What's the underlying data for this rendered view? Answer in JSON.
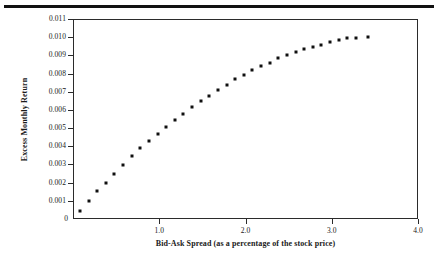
{
  "figure": {
    "top_rule": "horizontal-rule",
    "background_color": "#ffffff",
    "marker_color": "#101010",
    "axis_color": "#2b2b2b"
  },
  "chart_data": {
    "type": "scatter",
    "title": "",
    "subtitle": "",
    "xlabel": "Bid-Ask Spread (as a percentage of the stock price)",
    "ylabel": "Excess Monthly Return",
    "xlim": [
      0,
      4.0
    ],
    "ylim": [
      0,
      0.011
    ],
    "grid": false,
    "legend": null,
    "xticks": [
      0,
      1.0,
      2.0,
      3.0,
      4.0
    ],
    "xtick_labels": [
      "0",
      "1.0",
      "2.0",
      "3.0",
      "4.0"
    ],
    "yticks": [
      0,
      0.001,
      0.002,
      0.003,
      0.004,
      0.005,
      0.006,
      0.007,
      0.008,
      0.009,
      0.01,
      0.011
    ],
    "ytick_labels": [
      "0",
      "0.001",
      "0.002",
      "0.003",
      "0.004",
      "0.005",
      "0.006",
      "0.007",
      "0.008",
      "0.009",
      "0.010",
      "0.011"
    ],
    "x": [
      0.08,
      0.18,
      0.28,
      0.38,
      0.48,
      0.58,
      0.68,
      0.78,
      0.88,
      0.98,
      1.08,
      1.18,
      1.28,
      1.38,
      1.48,
      1.58,
      1.68,
      1.78,
      1.88,
      1.98,
      2.08,
      2.18,
      2.28,
      2.38,
      2.48,
      2.58,
      2.68,
      2.78,
      2.88,
      2.98,
      3.08,
      3.18,
      3.28,
      3.42
    ],
    "y": [
      0.00045,
      0.00098,
      0.00152,
      0.002,
      0.00246,
      0.00299,
      0.00347,
      0.00389,
      0.00429,
      0.00468,
      0.00508,
      0.00545,
      0.0058,
      0.00618,
      0.0065,
      0.00679,
      0.00709,
      0.00739,
      0.0077,
      0.00791,
      0.0082,
      0.00842,
      0.0086,
      0.00883,
      0.00904,
      0.00919,
      0.00934,
      0.00946,
      0.00956,
      0.00972,
      0.00984,
      0.00993,
      0.00998,
      0.01002
    ],
    "series": [
      {
        "name": "Excess Monthly Return vs Bid-Ask Spread",
        "marker": "square",
        "color": "#101010",
        "values": [
          0.00045,
          0.00098,
          0.00152,
          0.002,
          0.00246,
          0.00299,
          0.00347,
          0.00389,
          0.00429,
          0.00468,
          0.00508,
          0.00545,
          0.0058,
          0.00618,
          0.0065,
          0.00679,
          0.00709,
          0.00739,
          0.0077,
          0.00791,
          0.0082,
          0.00842,
          0.0086,
          0.00883,
          0.00904,
          0.00919,
          0.00934,
          0.00946,
          0.00956,
          0.00972,
          0.00984,
          0.00993,
          0.00998,
          0.01002
        ]
      }
    ]
  }
}
